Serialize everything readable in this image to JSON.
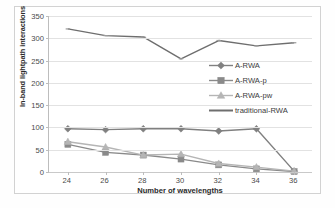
{
  "chart_data": {
    "type": "line",
    "title": "",
    "xlabel": "Number of wavelengths",
    "ylabel": "In-band lightpath interactions",
    "categories": [
      24,
      26,
      28,
      30,
      32,
      34,
      36
    ],
    "x": [
      24,
      26,
      28,
      30,
      32,
      34,
      36
    ],
    "xlim": [
      23,
      37
    ],
    "ylim": [
      0,
      350
    ],
    "yticks": [
      0,
      50,
      100,
      150,
      200,
      250,
      300,
      350
    ],
    "xticks": [
      24,
      26,
      28,
      30,
      32,
      34,
      36
    ],
    "grid": true,
    "legend_position": "center-right",
    "series": [
      {
        "name": "A-RWA",
        "marker": "diamond",
        "color": "#808080",
        "values": [
          97,
          95,
          97,
          97,
          92,
          97,
          2
        ]
      },
      {
        "name": "A-RWA-p",
        "marker": "square",
        "color": "#8a8a8a",
        "values": [
          62,
          44,
          38,
          29,
          16,
          7,
          1
        ]
      },
      {
        "name": "A-RWA-pw",
        "marker": "triangle",
        "color": "#b5b5b5",
        "values": [
          68,
          56,
          38,
          40,
          19,
          11,
          2
        ]
      },
      {
        "name": "traditional-RWA",
        "marker": "line",
        "color": "#6e6e6e",
        "values": [
          321,
          306,
          303,
          254,
          295,
          283,
          290
        ]
      }
    ]
  },
  "axes": {
    "y_tick_labels": [
      "0",
      "50",
      "100",
      "150",
      "200",
      "250",
      "300",
      "350"
    ],
    "x_tick_labels": [
      "24",
      "26",
      "28",
      "30",
      "32",
      "34",
      "36"
    ],
    "y_title": "In-band lightpath interactions",
    "x_title": "Number of wavelengths"
  },
  "legend": {
    "items": [
      {
        "label": "A-RWA",
        "marker": "diamond-marker-icon",
        "color": "#808080"
      },
      {
        "label": "A-RWA-p",
        "marker": "square-marker-icon",
        "color": "#8a8a8a"
      },
      {
        "label": "A-RWA-pw",
        "marker": "triangle-marker-icon",
        "color": "#b5b5b5"
      },
      {
        "label": "traditional-RWA",
        "marker": "line-marker-icon",
        "color": "#6e6e6e"
      }
    ]
  }
}
